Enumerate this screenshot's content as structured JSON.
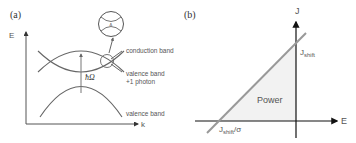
{
  "panel_a": {
    "label": "(a)",
    "axis_y": "E",
    "axis_x": "k",
    "conduction_band": "conduction band",
    "valence_band_photon_line1": "valence band",
    "valence_band_photon_line2": "+1 photon",
    "valence_band": "valence band",
    "photon_energy": "ħΩ"
  },
  "panel_b": {
    "label": "(b)",
    "axis_y": "J",
    "axis_x": "E",
    "intercept_y_main": "J",
    "intercept_y_sub": "shift",
    "intercept_x_main": "J",
    "intercept_x_sub": "shift",
    "intercept_x_suffix": "/σ",
    "region_label": "Power"
  },
  "colors": {
    "curve": "#555555",
    "line_b": "#909090",
    "fill_b": "#f2f2f2",
    "axis": "#222222"
  }
}
